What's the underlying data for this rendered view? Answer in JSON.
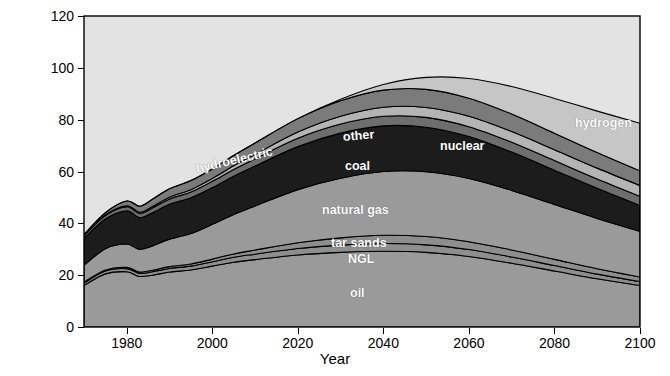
{
  "chart_data": {
    "type": "area",
    "stacked": true,
    "title": "",
    "xlabel": "Year",
    "ylabel": "Billion barrels of oil equivalent per year",
    "xlim": [
      1970,
      2100
    ],
    "ylim": [
      0,
      120
    ],
    "xticks": [
      1980,
      2000,
      2020,
      2040,
      2060,
      2080,
      2100
    ],
    "yticks": [
      0,
      20,
      40,
      60,
      80,
      100,
      120
    ],
    "grid": false,
    "legend": "inline-labels",
    "x": [
      1970,
      1975,
      1980,
      1983,
      1986,
      1990,
      1995,
      2000,
      2005,
      2010,
      2020,
      2030,
      2040,
      2050,
      2060,
      2070,
      2080,
      2090,
      2100
    ],
    "series": [
      {
        "name": "oil",
        "color": "#9a9a9a",
        "values": [
          16.0,
          20.5,
          21.3,
          19.5,
          20.0,
          21.2,
          22.0,
          23.5,
          25.0,
          26.0,
          27.8,
          28.8,
          29.2,
          28.8,
          27.2,
          24.6,
          21.6,
          18.6,
          16.0
        ]
      },
      {
        "name": "NGL",
        "color": "#8e8e8e",
        "values": [
          1.0,
          1.1,
          1.2,
          1.2,
          1.3,
          1.4,
          1.5,
          1.7,
          1.9,
          2.1,
          2.5,
          2.8,
          3.0,
          2.9,
          2.7,
          2.4,
          2.1,
          1.8,
          1.5
        ]
      },
      {
        "name": "tar sands",
        "color": "#8e8e8e",
        "values": [
          0.3,
          0.4,
          0.5,
          0.5,
          0.6,
          0.7,
          0.8,
          1.0,
          1.3,
          1.6,
          2.2,
          2.8,
          3.2,
          3.2,
          3.0,
          2.7,
          2.4,
          2.1,
          1.8
        ]
      },
      {
        "name": "natural gas",
        "color": "#9a9a9a",
        "values": [
          6.5,
          8.2,
          9.0,
          8.8,
          9.4,
          10.6,
          11.8,
          13.4,
          15.2,
          17.0,
          20.5,
          23.0,
          24.6,
          25.0,
          24.4,
          23.0,
          21.2,
          19.4,
          17.6
        ]
      },
      {
        "name": "coal",
        "color": "#1c1c1c",
        "values": [
          10.5,
          11.5,
          12.8,
          12.2,
          12.8,
          13.5,
          13.8,
          14.2,
          14.8,
          15.4,
          16.6,
          17.4,
          17.6,
          17.2,
          16.2,
          14.8,
          13.2,
          11.6,
          10.0
        ]
      },
      {
        "name": "hydroelectric",
        "color": "#6e6e6e",
        "values": [
          1.0,
          1.3,
          1.6,
          1.6,
          1.8,
          2.0,
          2.2,
          2.4,
          2.6,
          2.8,
          3.2,
          3.5,
          3.7,
          3.8,
          3.8,
          3.8,
          3.7,
          3.6,
          3.5
        ]
      },
      {
        "name": "other",
        "color": "#b4b4b4",
        "values": [
          0.2,
          0.3,
          0.4,
          0.5,
          0.6,
          0.7,
          0.9,
          1.1,
          1.4,
          1.7,
          2.4,
          3.0,
          3.5,
          3.8,
          4.0,
          4.1,
          4.2,
          4.2,
          4.2
        ]
      },
      {
        "name": "nuclear",
        "color": "#7b7b7b",
        "values": [
          0.2,
          0.8,
          1.8,
          2.3,
          2.8,
          3.2,
          3.5,
          3.7,
          4.0,
          4.4,
          5.2,
          6.0,
          6.6,
          7.0,
          7.0,
          6.8,
          6.4,
          6.0,
          5.6
        ]
      },
      {
        "name": "hydrogen",
        "color": "#c6c6c6",
        "values": [
          0,
          0,
          0,
          0,
          0,
          0,
          0,
          0,
          0,
          0,
          0,
          0.6,
          2.2,
          4.6,
          7.6,
          10.6,
          13.4,
          16.0,
          18.4
        ]
      }
    ],
    "area_labels": [
      {
        "name": "hydroelectric",
        "x": 196,
        "y": 162,
        "rotate": -13
      },
      {
        "name": "other",
        "x": 343,
        "y": 130,
        "rotate": -5
      },
      {
        "name": "nuclear",
        "x": 440,
        "y": 139,
        "rotate": 0
      },
      {
        "name": "coal",
        "x": 345,
        "y": 159,
        "rotate": 0
      },
      {
        "name": "natural gas",
        "x": 322,
        "y": 203,
        "rotate": 0
      },
      {
        "name": "tar sands",
        "x": 331,
        "y": 236,
        "rotate": 0
      },
      {
        "name": "NGL",
        "x": 348,
        "y": 252,
        "rotate": 0
      },
      {
        "name": "oil",
        "x": 350,
        "y": 286,
        "rotate": 0
      },
      {
        "name": "hydrogen",
        "x": 575,
        "y": 116,
        "rotate": 0
      }
    ],
    "plot_background": "#e3e3e3",
    "axis_color": "#000000"
  }
}
